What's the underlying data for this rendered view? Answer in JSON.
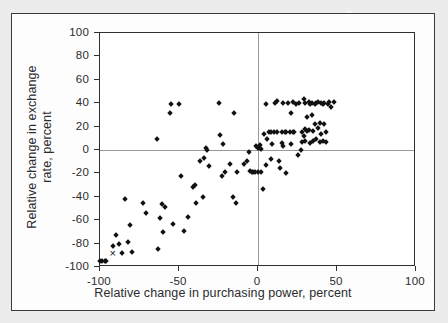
{
  "figure": {
    "background_color": "#ececed",
    "panel_color": "#fdfdfd",
    "frame_color": "#3a3a3c",
    "marker_color": "#121214"
  },
  "chart_data": {
    "type": "scatter",
    "title": "",
    "xlabel": "Relative change in purchasing power, percent",
    "ylabel_line1": "Relative change in exchange",
    "ylabel_line2": "rate, percent",
    "xlim": [
      -100,
      100
    ],
    "ylim": [
      -100,
      100
    ],
    "xticks": [
      -100,
      -50,
      0,
      50,
      100
    ],
    "xticklabels": [
      "-100",
      "-50",
      "0",
      "50",
      "100"
    ],
    "yticks": [
      -100,
      -80,
      -60,
      -40,
      -20,
      0,
      20,
      40,
      60,
      80,
      100
    ],
    "yticklabels": [
      "-100",
      "-80",
      "-60",
      "-40",
      "-20",
      "0",
      "20",
      "40",
      "60",
      "80",
      "100"
    ],
    "grid": false,
    "zero_lines": true,
    "legend": null,
    "marker": "diamond",
    "series": [
      {
        "name": "countries",
        "marker": "diamond",
        "points": [
          [
            -100,
            -95
          ],
          [
            -99,
            -95
          ],
          [
            -97,
            -95
          ],
          [
            -96,
            -95
          ],
          [
            -92,
            -82
          ],
          [
            -90,
            -73
          ],
          [
            -88,
            -80
          ],
          [
            -86,
            -88
          ],
          [
            -84,
            -42
          ],
          [
            -82,
            -79
          ],
          [
            -81,
            -64
          ],
          [
            -80,
            -87
          ],
          [
            -73,
            -45
          ],
          [
            -71,
            -54
          ],
          [
            -64,
            9
          ],
          [
            -63,
            -85
          ],
          [
            -62,
            -58
          ],
          [
            -61,
            -46
          ],
          [
            -60,
            -70
          ],
          [
            -59,
            -49
          ],
          [
            -56,
            32
          ],
          [
            -55,
            39
          ],
          [
            -54,
            -63
          ],
          [
            -50,
            39
          ],
          [
            -49,
            -22
          ],
          [
            -47,
            -69
          ],
          [
            -44,
            -57
          ],
          [
            -41,
            -32
          ],
          [
            -40,
            -30
          ],
          [
            -39,
            -45
          ],
          [
            -37,
            -9
          ],
          [
            -35,
            -40
          ],
          [
            -34,
            -7
          ],
          [
            -33,
            2
          ],
          [
            -32,
            0
          ],
          [
            -31,
            -14
          ],
          [
            -25,
            40
          ],
          [
            -24,
            13
          ],
          [
            -23,
            -22
          ],
          [
            -22,
            5
          ],
          [
            -21,
            -19
          ],
          [
            -18,
            -12
          ],
          [
            -16,
            -40
          ],
          [
            -15,
            32
          ],
          [
            -14,
            -45
          ],
          [
            -13,
            -19
          ],
          [
            -9,
            -12
          ],
          [
            -7,
            -9
          ],
          [
            -6,
            -2
          ],
          [
            -5,
            -18
          ],
          [
            -4,
            -19
          ],
          [
            -3,
            -19
          ],
          [
            -2,
            -19
          ],
          [
            -1,
            3
          ],
          [
            0,
            2
          ],
          [
            0,
            -19
          ],
          [
            1,
            4
          ],
          [
            2,
            1
          ],
          [
            2,
            -19
          ],
          [
            3,
            -33
          ],
          [
            4,
            14
          ],
          [
            5,
            -13
          ],
          [
            5,
            39
          ],
          [
            6,
            9
          ],
          [
            7,
            15
          ],
          [
            8,
            15
          ],
          [
            8,
            -8
          ],
          [
            9,
            5
          ],
          [
            10,
            15
          ],
          [
            11,
            40
          ],
          [
            12,
            15
          ],
          [
            12,
            42
          ],
          [
            13,
            -9
          ],
          [
            14,
            -15
          ],
          [
            15,
            6
          ],
          [
            15,
            15
          ],
          [
            16,
            40
          ],
          [
            16,
            3
          ],
          [
            17,
            15
          ],
          [
            18,
            15
          ],
          [
            18,
            -20
          ],
          [
            19,
            40
          ],
          [
            20,
            15
          ],
          [
            21,
            5
          ],
          [
            21,
            32
          ],
          [
            22,
            15
          ],
          [
            22,
            41
          ],
          [
            23,
            15
          ],
          [
            24,
            39
          ],
          [
            25,
            -4
          ],
          [
            26,
            40
          ],
          [
            27,
            0
          ],
          [
            28,
            15
          ],
          [
            28,
            7
          ],
          [
            29,
            12
          ],
          [
            29,
            44
          ],
          [
            30,
            18
          ],
          [
            30,
            40
          ],
          [
            30,
            8
          ],
          [
            31,
            16
          ],
          [
            31,
            28
          ],
          [
            32,
            41
          ],
          [
            32,
            17
          ],
          [
            33,
            39
          ],
          [
            33,
            6
          ],
          [
            34,
            30
          ],
          [
            34,
            40
          ],
          [
            35,
            16
          ],
          [
            35,
            8
          ],
          [
            36,
            39
          ],
          [
            36,
            22
          ],
          [
            37,
            40
          ],
          [
            37,
            9
          ],
          [
            38,
            41
          ],
          [
            38,
            19
          ],
          [
            39,
            23
          ],
          [
            39,
            7
          ],
          [
            40,
            40
          ],
          [
            40,
            14
          ],
          [
            41,
            39
          ],
          [
            41,
            8
          ],
          [
            42,
            22
          ],
          [
            42,
            40
          ],
          [
            43,
            15
          ],
          [
            43,
            7
          ],
          [
            44,
            39
          ],
          [
            45,
            41
          ],
          [
            46,
            37
          ],
          [
            48,
            41
          ]
        ]
      },
      {
        "name": "highlighted-country",
        "marker": "x",
        "points": [
          [
            -92,
            -88
          ]
        ]
      }
    ]
  }
}
